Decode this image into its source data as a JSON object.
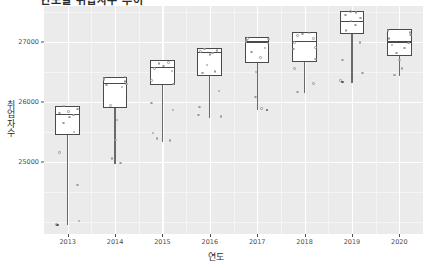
{
  "chart_data": {
    "type": "boxplot",
    "title": "연도별 취업자수 추이",
    "xlabel": "연도",
    "ylabel": "취업자수",
    "categories": [
      "2013",
      "2014",
      "2015",
      "2016",
      "2017",
      "2018",
      "2019",
      "2020"
    ],
    "ylim": [
      23800,
      27600
    ],
    "yticks": [
      25000,
      26000,
      27000
    ],
    "ytick_labels": [
      "25000",
      "26000",
      "27000"
    ],
    "grid": true,
    "legend": "none",
    "jitter_points": true,
    "boxes": [
      {
        "category": "2013",
        "min": 23950,
        "q1": 25450,
        "median": 25800,
        "q3": 25880,
        "max": 25930,
        "points": [
          25880,
          25820,
          25780,
          25930,
          25840,
          25750,
          25650,
          25500,
          25160,
          24620,
          23960,
          24020
        ],
        "outliers": [
          23950
        ]
      },
      {
        "category": "2014",
        "min": 24960,
        "q1": 25900,
        "median": 26320,
        "q3": 26380,
        "max": 26420,
        "points": [
          26340,
          26370,
          26300,
          26390,
          26420,
          26280,
          26250,
          25940,
          25700,
          25370,
          25060,
          24980
        ],
        "outliers": []
      },
      {
        "category": "2015",
        "min": 25330,
        "q1": 26280,
        "median": 26580,
        "q3": 26640,
        "max": 26700,
        "points": [
          26600,
          26640,
          26660,
          26560,
          26520,
          26360,
          26300,
          25980,
          25870,
          25480,
          25360,
          25390
        ],
        "outliers": []
      },
      {
        "category": "2016",
        "min": 25740,
        "q1": 26430,
        "median": 26830,
        "q3": 26860,
        "max": 26900,
        "points": [
          26840,
          26860,
          26880,
          26820,
          26790,
          26620,
          26510,
          26480,
          26180,
          25920,
          25760,
          25780
        ],
        "outliers": []
      },
      {
        "category": "2017",
        "min": 25870,
        "q1": 26650,
        "median": 27010,
        "q3": 27040,
        "max": 27080,
        "points": [
          27030,
          27050,
          27010,
          26980,
          27060,
          26900,
          26830,
          26740,
          26500,
          26080,
          25890
        ],
        "outliers": [
          25870
        ]
      },
      {
        "category": "2018",
        "min": 26150,
        "q1": 26660,
        "median": 27020,
        "q3": 27100,
        "max": 27170,
        "points": [
          27130,
          27150,
          27110,
          27060,
          26990,
          26910,
          26880,
          26720,
          26560,
          26310,
          26170
        ],
        "outliers": []
      },
      {
        "category": "2019",
        "min": 26320,
        "q1": 27140,
        "median": 27350,
        "q3": 27420,
        "max": 27520,
        "points": [
          27400,
          27450,
          27490,
          27510,
          27350,
          27280,
          27190,
          26990,
          26700,
          26480,
          26360
        ],
        "outliers": [
          26330
        ]
      },
      {
        "category": "2020",
        "min": 26430,
        "q1": 26770,
        "median": 27010,
        "q3": 27120,
        "max": 27210,
        "points": [
          27160,
          27190,
          27120,
          27060,
          26980,
          26950,
          26900,
          26820,
          26700,
          26560,
          26450
        ],
        "outliers": []
      }
    ]
  }
}
